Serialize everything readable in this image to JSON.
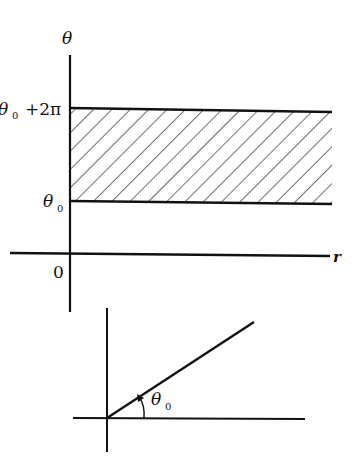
{
  "top_diagram": {
    "vertical_axis_label": "θ",
    "horizontal_axis_label": "r",
    "origin_label": "0",
    "upper_bound_label_symbol": "θ",
    "upper_bound_label_subscript": "0",
    "upper_bound_label_suffix": "+2π",
    "lower_bound_label_symbol": "θ",
    "lower_bound_label_subscript": "0",
    "region": "hatched strip θ0 ≤ θ ≤ θ0+2π, r > 0"
  },
  "bottom_diagram": {
    "angle_label_symbol": "θ",
    "angle_label_subscript": "0",
    "description": "ray from origin at angle θ0 with arrow arc"
  },
  "colors": {
    "ink": "#111111",
    "background": "#ffffff"
  }
}
